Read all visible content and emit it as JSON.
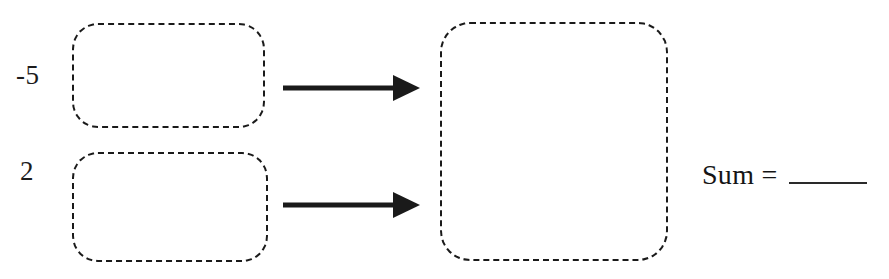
{
  "worksheet": {
    "kind": "integer-addition-worksheet",
    "width": 889,
    "height": 279,
    "background_color": "#ffffff",
    "ink_color": "#1a1a1a"
  },
  "operands": [
    {
      "label": "-5",
      "box_name": "addend-box-1",
      "value": -5
    },
    {
      "label": "2",
      "box_name": "addend-box-2",
      "value": 2
    }
  ],
  "boxes": {
    "addend_1": {
      "name": "addend-box-1",
      "content": "",
      "border_style": "dashed"
    },
    "addend_2": {
      "name": "addend-box-2",
      "content": "",
      "border_style": "dashed"
    },
    "result": {
      "name": "result-box",
      "content": "",
      "border_style": "dashed"
    }
  },
  "arrows": [
    {
      "name": "arrow-addend-1-to-result",
      "direction": "right"
    },
    {
      "name": "arrow-addend-2-to-result",
      "direction": "right"
    }
  ],
  "sum": {
    "label": "Sum =",
    "answer": "",
    "blank_underline": true
  }
}
